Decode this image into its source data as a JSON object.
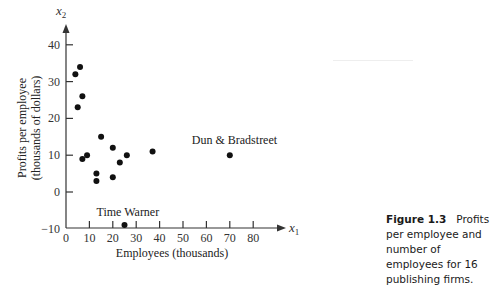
{
  "figure": {
    "caption_label": "Figure 1.3",
    "caption_text": "Profits per employee and number of employees for 16 publishing firms."
  },
  "chart_data": {
    "type": "scatter",
    "title": "",
    "xlabel": "Employees (thousands)",
    "ylabel_line1": "Profits per employee",
    "ylabel_line2": "(thousands of dollars)",
    "x_axis_symbol": "x",
    "x_axis_subscript": "1",
    "y_axis_symbol": "x",
    "y_axis_subscript": "2",
    "xlim": [
      0,
      90
    ],
    "ylim": [
      -10,
      45
    ],
    "x_ticks": [
      0,
      10,
      20,
      30,
      40,
      50,
      60,
      70,
      80
    ],
    "y_ticks": [
      -10,
      0,
      10,
      20,
      30,
      40
    ],
    "grid": false,
    "legend": null,
    "point_color": "#111111",
    "points": [
      {
        "x": 6,
        "y": 34
      },
      {
        "x": 4,
        "y": 32
      },
      {
        "x": 7,
        "y": 26
      },
      {
        "x": 5,
        "y": 23
      },
      {
        "x": 15,
        "y": 15
      },
      {
        "x": 20,
        "y": 12
      },
      {
        "x": 9,
        "y": 10
      },
      {
        "x": 7,
        "y": 9
      },
      {
        "x": 26,
        "y": 10
      },
      {
        "x": 23,
        "y": 8
      },
      {
        "x": 37,
        "y": 11
      },
      {
        "x": 13,
        "y": 5
      },
      {
        "x": 13,
        "y": 3
      },
      {
        "x": 20,
        "y": 4
      },
      {
        "x": 70,
        "y": 10,
        "label": "Dun & Bradstreet"
      },
      {
        "x": 25,
        "y": -9,
        "label": "Time Warner"
      }
    ],
    "annotations": [
      {
        "text": "Dun & Bradstreet",
        "x": 70,
        "y": 10
      },
      {
        "text": "Time Warner",
        "x": 25,
        "y": -9
      }
    ]
  }
}
